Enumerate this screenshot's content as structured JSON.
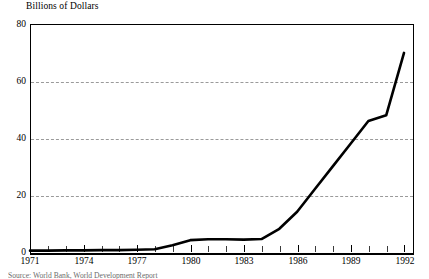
{
  "chart_data": {
    "type": "line",
    "title": "Billions of Dollars",
    "xlabel": "",
    "ylabel": "Billions of Dollars",
    "xlim": [
      1971,
      1992
    ],
    "ylim": [
      0,
      80
    ],
    "yticks": [
      0,
      20,
      40,
      60,
      80
    ],
    "ytick_labels": [
      "0",
      "20",
      "40",
      "60",
      "80"
    ],
    "xticks": [
      1971,
      1972,
      1973,
      1974,
      1975,
      1976,
      1977,
      1978,
      1979,
      1980,
      1981,
      1982,
      1983,
      1984,
      1985,
      1986,
      1987,
      1988,
      1989,
      1990,
      1991,
      1992
    ],
    "xtick_labels": [
      "1971",
      "1974",
      "1977",
      "1980",
      "1983",
      "1986",
      "1989",
      "1992"
    ],
    "labeled_xticks": [
      1971,
      1974,
      1977,
      1980,
      1983,
      1986,
      1989,
      1992
    ],
    "grid": "horizontal dashed at 20, 40, 60",
    "legend": "none",
    "series": [
      {
        "name": "Value",
        "color": "#000000",
        "x": [
          1971,
          1972,
          1973,
          1974,
          1975,
          1976,
          1977,
          1978,
          1979,
          1980,
          1981,
          1982,
          1983,
          1984,
          1985,
          1986,
          1987,
          1988,
          1989,
          1990,
          1991,
          1992
        ],
        "values": [
          0.3,
          0.3,
          0.4,
          0.4,
          0.5,
          0.5,
          0.6,
          0.8,
          2.2,
          4.0,
          4.3,
          4.3,
          4.2,
          4.4,
          8.0,
          14.0,
          22.0,
          30.0,
          38.0,
          46.0,
          48.0,
          70.0
        ]
      }
    ]
  },
  "source_note": "Source: World Bank, World Development Report"
}
